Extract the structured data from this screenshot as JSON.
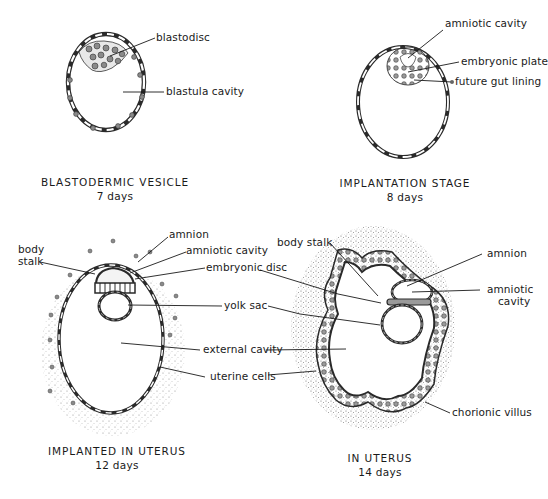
{
  "diagram": {
    "panels": [
      {
        "id": "blastodermic-vesicle",
        "title": "BLASTODERMIC VESICLE",
        "subtitle": "7 days",
        "labels": [
          "blastodisc",
          "blastula cavity"
        ]
      },
      {
        "id": "implantation-stage",
        "title": "IMPLANTATION STAGE",
        "subtitle": "8 days",
        "labels": [
          "amniotic cavity",
          "embryonic plate",
          "future gut lining"
        ]
      },
      {
        "id": "implanted-in-uterus",
        "title": "IMPLANTED IN UTERUS",
        "subtitle": "12 days",
        "labels": [
          "body stalk",
          "amnion",
          "amniotic cavity",
          "embryonic disc",
          "yolk sac",
          "external cavity",
          "uterine cells"
        ]
      },
      {
        "id": "in-uterus",
        "title": "IN UTERUS",
        "subtitle": "14 days",
        "labels": [
          "body stalk",
          "amnion",
          "amniotic cavity",
          "chorionic villus"
        ]
      }
    ],
    "p1": {
      "title": "BLASTODERMIC VESICLE",
      "subtitle": "7 days",
      "blastodisc": "blastodisc",
      "blastula_cavity": "blastula cavity"
    },
    "p2": {
      "title": "IMPLANTATION STAGE",
      "subtitle": "8 days",
      "amniotic_cavity": "amniotic cavity",
      "embryonic_plate": "embryonic plate",
      "future_gut_lining": "future gut lining"
    },
    "p3": {
      "title": "IMPLANTED IN UTERUS",
      "subtitle": "12 days",
      "body_stalk_1": "body",
      "body_stalk_2": "stalk",
      "amnion": "amnion",
      "amniotic_cavity": "amniotic cavity",
      "embryonic_disc": "embryonic disc",
      "yolk_sac": "yolk sac",
      "external_cavity": "external cavity",
      "uterine_cells": "uterine cells"
    },
    "p4": {
      "title": "IN UTERUS",
      "subtitle": "14 days",
      "body_stalk": "body stalk",
      "amnion": "amnion",
      "amniotic_cavity_1": "amniotic",
      "amniotic_cavity_2": "cavity",
      "chorionic_villus": "chorionic villus"
    },
    "colors": {
      "ink": "#1a1a1a",
      "cell_fill": "#8a8a8a",
      "stipple": "#9a9a9a",
      "background": "#ffffff"
    }
  }
}
